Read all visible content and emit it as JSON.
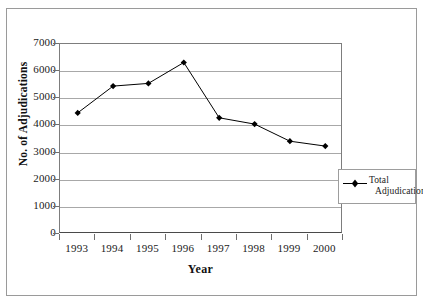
{
  "chart_data": {
    "type": "line",
    "title": "",
    "xlabel": "Year",
    "ylabel": "No. of Adjudications",
    "categories": [
      "1993",
      "1994",
      "1995",
      "1996",
      "1997",
      "1998",
      "1999",
      "2000"
    ],
    "series": [
      {
        "name": "Total Adjudications",
        "marker": "diamond",
        "color": "#000000",
        "values": [
          4460,
          5450,
          5550,
          6320,
          4280,
          4050,
          3420,
          3240
        ]
      }
    ],
    "ylim": [
      0,
      7000
    ],
    "yticks": [
      0,
      1000,
      2000,
      3000,
      4000,
      5000,
      6000,
      7000
    ],
    "ytick_labels": [
      "0",
      "1000",
      "2000",
      "3000",
      "4000",
      "5000",
      "6000",
      "7000"
    ],
    "grid": "horizontal",
    "legend_position": "right"
  },
  "axes": {
    "y_title": "No. of Adjudications",
    "x_title": "Year"
  },
  "legend": {
    "entries": [
      {
        "label_line1": "Total",
        "label_line2": "Adjudications",
        "marker": "diamond-marker-icon"
      }
    ]
  }
}
